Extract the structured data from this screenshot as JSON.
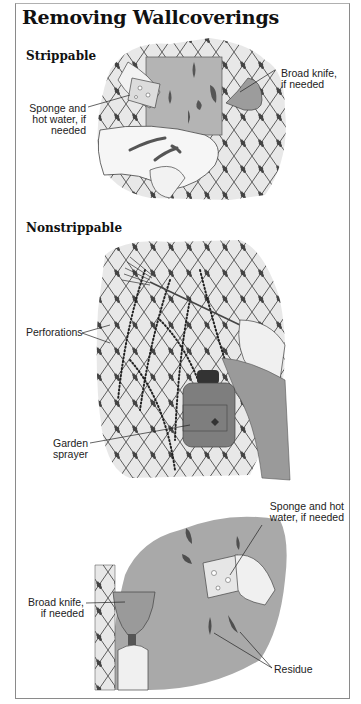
{
  "page": {
    "title": "Removing Wallcoverings"
  },
  "sections": [
    {
      "heading": "Strippable",
      "labels": [
        {
          "text": "Broad knife,\nif needed"
        },
        {
          "text": "Sponge and\nhot water, if\nneeded"
        }
      ]
    },
    {
      "heading": "Nonstrippable",
      "labels": [
        {
          "text": "Perforations"
        },
        {
          "text": "Garden\nsprayer"
        }
      ]
    },
    {
      "heading": "",
      "labels": [
        {
          "text": "Sponge and hot\nwater, if needed"
        },
        {
          "text": "Broad knife,\nif needed"
        },
        {
          "text": "Residue"
        }
      ]
    }
  ],
  "colors": {
    "wallpaper_bg": "#e6e6e6",
    "trellis_line": "#3a3a3a",
    "bare_wall": "#a9a9a9",
    "residue": "#555555",
    "knife": "#9a9a9a",
    "sprayer": "#7a7a7a"
  }
}
